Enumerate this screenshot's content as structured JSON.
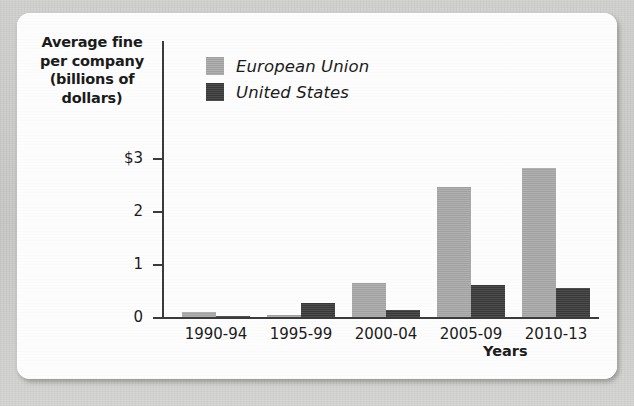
{
  "chart_data": {
    "type": "bar",
    "title": "",
    "ylabel": "Average fine per company (billions of dollars)",
    "ylabel_lines": [
      "Average fine",
      "per company",
      "(billions of",
      "dollars)"
    ],
    "xlabel": "Years",
    "categories": [
      "1990-94",
      "1995-99",
      "2000-04",
      "2005-09",
      "2010-13"
    ],
    "series": [
      {
        "name": "European Union",
        "color": "#a8a8a8",
        "values": [
          0.1,
          0.03,
          0.65,
          2.45,
          2.82
        ]
      },
      {
        "name": "United States",
        "color": "#3a3a3a",
        "values": [
          0.02,
          0.27,
          0.14,
          0.6,
          0.55
        ]
      }
    ],
    "ylim": [
      0,
      3.0
    ],
    "ytick_values": [
      3,
      2,
      1,
      0
    ],
    "ytick_labels": [
      "$3",
      "2",
      "1",
      "0"
    ],
    "grid": false,
    "legend_position": "top-left-inside"
  },
  "colors": {
    "european_union": "#a8a8a8",
    "united_states": "#3a3a3a",
    "axis": "#3b3b3b",
    "text": "#1b1b1b",
    "card_background": "#fdfdfd",
    "page_background": "#cdcdcb"
  }
}
